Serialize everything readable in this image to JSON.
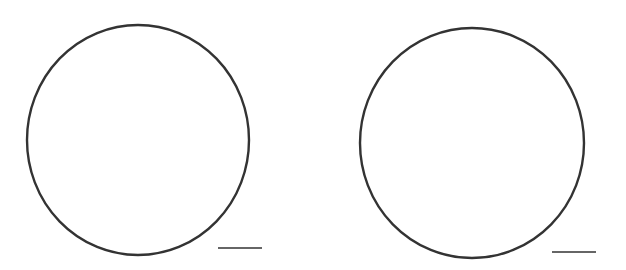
{
  "figure": {
    "background": "#ffffff",
    "stroke_color": "#333333",
    "panels": [
      {
        "id": "left",
        "circle": {
          "cx": 138,
          "cy": 140,
          "rx": 111,
          "ry": 115,
          "stroke_width": 2.4
        },
        "scale_bar": {
          "x1": 218,
          "x2": 262,
          "y": 248,
          "stroke_width": 1.6
        }
      },
      {
        "id": "right",
        "circle": {
          "cx": 472,
          "cy": 143,
          "rx": 112,
          "ry": 115,
          "stroke_width": 2.4
        },
        "scale_bar": {
          "x1": 552,
          "x2": 596,
          "y": 252,
          "stroke_width": 1.6
        }
      }
    ]
  }
}
